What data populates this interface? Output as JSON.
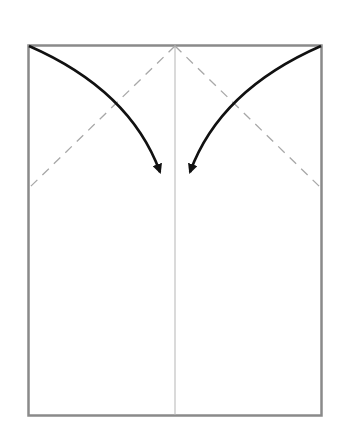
{
  "diagram": {
    "type": "origami-fold-step",
    "colors": {
      "paper_edge": "#8a8a8a",
      "center_crease": "#b0b0b0",
      "valley_fold": "#a8a8a8",
      "arrow": "#111111",
      "background": "#ffffff"
    }
  }
}
